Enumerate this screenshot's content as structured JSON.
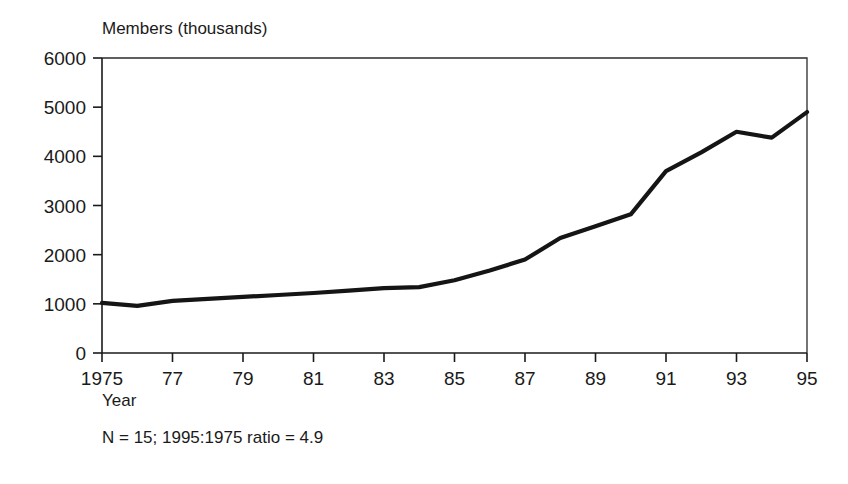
{
  "chart_data": {
    "type": "line",
    "title": "",
    "ylabel": "Members (thousands)",
    "xlabel": "Year",
    "annotation": "N = 15; 1995:1975 ratio = 4.9",
    "x": [
      1975,
      1976,
      1977,
      1978,
      1979,
      1980,
      1981,
      1982,
      1983,
      1984,
      1985,
      1986,
      1987,
      1988,
      1989,
      1990,
      1991,
      1992,
      1993,
      1994,
      1995
    ],
    "values": [
      1020,
      960,
      1060,
      1100,
      1140,
      1180,
      1220,
      1270,
      1320,
      1340,
      1480,
      1680,
      1900,
      2340,
      2580,
      2820,
      3700,
      4080,
      4500,
      4380,
      4900
    ],
    "series": [
      {
        "name": "Members",
        "values": [
          1020,
          960,
          1060,
          1100,
          1140,
          1180,
          1220,
          1270,
          1320,
          1340,
          1480,
          1680,
          1900,
          2340,
          2580,
          2820,
          3700,
          4080,
          4500,
          4380,
          4900
        ]
      }
    ],
    "xlim": [
      1975,
      1995
    ],
    "ylim": [
      0,
      6000
    ],
    "xticks": [
      1975,
      1977,
      1979,
      1981,
      1983,
      1985,
      1987,
      1989,
      1991,
      1993,
      1995
    ],
    "xtick_labels": [
      "1975",
      "77",
      "79",
      "81",
      "83",
      "85",
      "87",
      "89",
      "91",
      "93",
      "95"
    ],
    "yticks": [
      0,
      1000,
      2000,
      3000,
      4000,
      5000,
      6000
    ],
    "ytick_labels": [
      "0",
      "1000",
      "2000",
      "3000",
      "4000",
      "5000",
      "6000"
    ],
    "grid": false,
    "legend": "none",
    "line_color": "#151515",
    "axis_color": "#1a1a1a",
    "background_color": "#ffffff"
  },
  "labels": {
    "y_axis_title": "Members (thousands)",
    "x_axis_title": "Year",
    "footnote": "N = 15; 1995:1975 ratio = 4.9"
  }
}
